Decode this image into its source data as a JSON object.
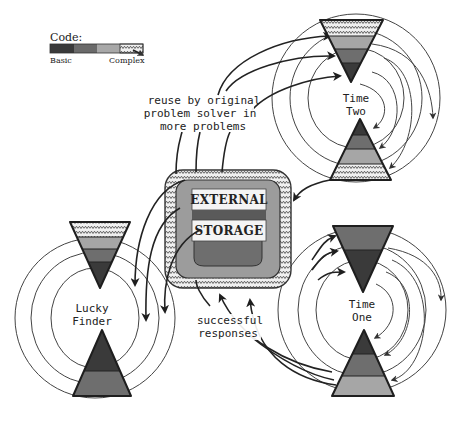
{
  "legend": {
    "title": "Code:",
    "left_label": "Basic",
    "right_label": "Complex",
    "swatches": [
      {
        "level": "basic",
        "color": "#3a3a3a"
      },
      {
        "level": "intermediate-1",
        "color": "#6a6a6a"
      },
      {
        "level": "intermediate-2",
        "color": "#a8a8a8"
      },
      {
        "level": "complex",
        "color": "#e8e8e8",
        "pattern": "zigzag"
      }
    ]
  },
  "colors": {
    "basic": "#3a3a3a",
    "level2": "#6e6e6e",
    "level3": "#a6a6a6",
    "complex_bg": "#ededed",
    "outline": "#1e1e1e",
    "storage_inner": "#9c9c9c",
    "storage_dome": "#5a5a5a",
    "storage_label_bg": "#f4f4f4"
  },
  "nodes": {
    "time_two": {
      "line1": "Time",
      "line2": "Two"
    },
    "time_one": {
      "line1": "Time",
      "line2": "One"
    },
    "lucky_finder": {
      "line1": "Lucky",
      "line2": "Finder"
    },
    "external_storage": {
      "line1": "EXTERNAL",
      "line2": "STORAGE"
    }
  },
  "annotations": {
    "reuse": {
      "line1": "reuse by original",
      "line2": "problem  solver in",
      "line3": "more problems"
    },
    "successful": {
      "line1": "successful",
      "line2": "responses"
    }
  }
}
